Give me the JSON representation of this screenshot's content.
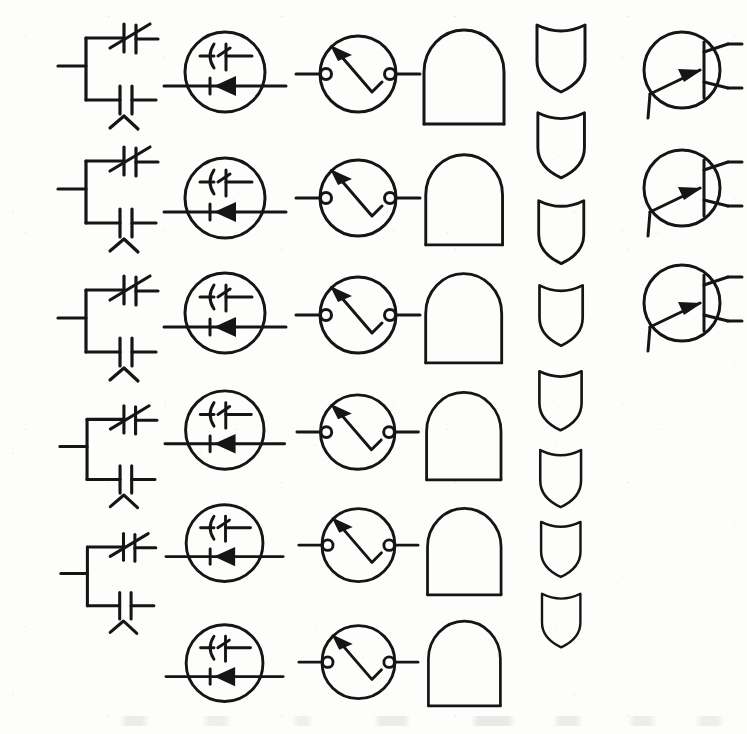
{
  "page": {
    "kind": "scanned-drawing-sheet",
    "width": 747,
    "height": 734,
    "background_color": "#fdfdfc",
    "ink_color": "#151515"
  },
  "columns": [
    {
      "id": "col-1",
      "symbol_name": "parallel-capacitor-network",
      "description": "Variable capacitor in parallel with fixed capacitor, left lead, small zigzag mark below",
      "center_x": 108,
      "count": 5,
      "items": [
        {
          "label": "parallel-capacitor-network-1",
          "cy": 75,
          "scale": 1.0
        },
        {
          "label": "parallel-capacitor-network-2",
          "cy": 198,
          "scale": 1.0
        },
        {
          "label": "parallel-capacitor-network-3",
          "cy": 327,
          "scale": 1.0
        },
        {
          "label": "parallel-capacitor-network-4",
          "cy": 455,
          "scale": 0.97
        },
        {
          "label": "parallel-capacitor-network-5",
          "cy": 582,
          "scale": 0.95
        }
      ]
    },
    {
      "id": "col-2",
      "symbol_name": "encircled-capacitor-diode",
      "description": "Circle enclosing a capacitor above a series diode on a horizontal through-line",
      "center_x": 225,
      "count": 6,
      "items": [
        {
          "label": "encircled-capacitor-diode-1",
          "cy": 72,
          "scale": 1.0
        },
        {
          "label": "encircled-capacitor-diode-2",
          "cy": 198,
          "scale": 1.0
        },
        {
          "label": "encircled-capacitor-diode-3",
          "cy": 313,
          "scale": 1.0
        },
        {
          "label": "encircled-capacitor-diode-4",
          "cy": 430,
          "scale": 0.98
        },
        {
          "label": "encircled-capacitor-diode-5",
          "cy": 543,
          "scale": 0.96
        },
        {
          "label": "encircled-capacitor-diode-6",
          "cy": 663,
          "scale": 0.96
        }
      ]
    },
    {
      "id": "col-3",
      "symbol_name": "encircled-zigzag-arrow-switch",
      "description": "Circle with two open terminals and an internal zigzag line ending in an up-left arrow",
      "center_x": 358,
      "count": 6,
      "items": [
        {
          "label": "encircled-zigzag-arrow-switch-1",
          "cy": 74,
          "scale": 1.0
        },
        {
          "label": "encircled-zigzag-arrow-switch-2",
          "cy": 198,
          "scale": 1.0
        },
        {
          "label": "encircled-zigzag-arrow-switch-3",
          "cy": 315,
          "scale": 1.0
        },
        {
          "label": "encircled-zigzag-arrow-switch-4",
          "cy": 432,
          "scale": 0.98
        },
        {
          "label": "encircled-zigzag-arrow-switch-5",
          "cy": 545,
          "scale": 0.96
        },
        {
          "label": "encircled-zigzag-arrow-switch-6",
          "cy": 662,
          "scale": 0.96
        }
      ]
    },
    {
      "id": "col-4",
      "symbol_name": "arch-outline",
      "description": "Dome / arch outline: semicircular top on vertical sides with open flat base",
      "center_x": 464,
      "count": 6,
      "items": [
        {
          "label": "arch-outline-1",
          "cy": 75,
          "scale": 1.0
        },
        {
          "label": "arch-outline-2",
          "cy": 198,
          "scale": 0.96
        },
        {
          "label": "arch-outline-3",
          "cy": 316,
          "scale": 0.95
        },
        {
          "label": "arch-outline-4",
          "cy": 434,
          "scale": 0.93
        },
        {
          "label": "arch-outline-5",
          "cy": 550,
          "scale": 0.92
        },
        {
          "label": "arch-outline-6",
          "cy": 662,
          "scale": 0.9
        }
      ]
    },
    {
      "id": "col-5",
      "symbol_name": "shield-outline",
      "description": "Heraldic shield outline with concave top edge and rounded point at the base",
      "center_x": 561,
      "count": 8,
      "items": [
        {
          "label": "shield-outline-1",
          "cy": 58,
          "scale": 1.0
        },
        {
          "label": "shield-outline-2",
          "cy": 145,
          "scale": 0.97
        },
        {
          "label": "shield-outline-3",
          "cy": 232,
          "scale": 0.94
        },
        {
          "label": "shield-outline-4",
          "cy": 315,
          "scale": 0.9
        },
        {
          "label": "shield-outline-5",
          "cy": 400,
          "scale": 0.88
        },
        {
          "label": "shield-outline-6",
          "cy": 478,
          "scale": 0.85
        },
        {
          "label": "shield-outline-7",
          "cy": 549,
          "scale": 0.82
        },
        {
          "label": "shield-outline-8",
          "cy": 620,
          "scale": 0.8
        }
      ]
    },
    {
      "id": "col-6",
      "symbol_name": "encircled-bjt-transistor",
      "description": "Bipolar junction transistor in a circle: base bar, emitter arrow pointing inward, two right-hand leads and one lower-left lead",
      "center_x": 686,
      "count": 3,
      "items": [
        {
          "label": "encircled-bjt-transistor-1",
          "cy": 72,
          "scale": 1.0
        },
        {
          "label": "encircled-bjt-transistor-2",
          "cy": 190,
          "scale": 1.0
        },
        {
          "label": "encircled-bjt-transistor-3",
          "cy": 305,
          "scale": 1.0
        }
      ]
    }
  ]
}
